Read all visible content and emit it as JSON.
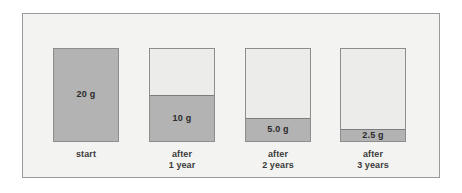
{
  "figure": {
    "type": "radioactive-decay-bar-diagram",
    "background_color": "#f3f3f1",
    "frame_border_color": "#9a9a9a",
    "fill_color": "#b3b3b3",
    "empty_color": "#ececea",
    "bar_border_color": "#8d8d8d"
  },
  "chart_data": {
    "type": "bar",
    "title": "",
    "xlabel": "",
    "ylabel": "",
    "unit": "g",
    "initial_value": 20,
    "half_life_years": 1,
    "ylim": [
      0,
      20
    ],
    "grid": false,
    "legend": null,
    "categories": [
      "start",
      "after 1 year",
      "after 2 years",
      "after 3 years"
    ],
    "values": [
      20,
      10,
      5.0,
      2.5
    ],
    "value_labels": [
      "20 g",
      "10 g",
      "5.0 g",
      "2.5 g"
    ],
    "fractions_remaining": [
      1,
      0.5,
      0.25,
      0.125
    ]
  },
  "bars": [
    {
      "id": "bar-start",
      "value_label": "20 g",
      "value": 20,
      "fraction": 1,
      "caption_lines": [
        "start"
      ],
      "label_inside": true
    },
    {
      "id": "bar-after-1-year",
      "value_label": "10 g",
      "value": 10,
      "fraction": 0.5,
      "caption_lines": [
        "after",
        "1 year"
      ],
      "label_inside": true
    },
    {
      "id": "bar-after-2-years",
      "value_label": "5.0 g",
      "value": 5.0,
      "fraction": 0.25,
      "caption_lines": [
        "after",
        "2 years"
      ],
      "label_inside": true
    },
    {
      "id": "bar-after-3-years",
      "value_label": "2.5 g",
      "value": 2.5,
      "fraction": 0.125,
      "caption_lines": [
        "after",
        "3 years"
      ],
      "label_inside": true
    }
  ]
}
